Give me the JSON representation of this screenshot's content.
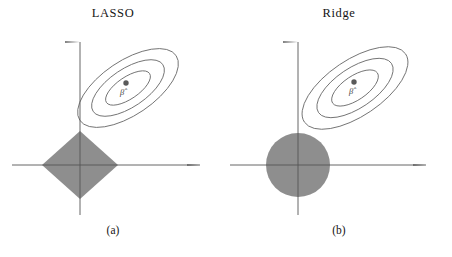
{
  "figure": {
    "type": "diagram",
    "background_color": "#ffffff",
    "axis_color": "#555555",
    "contour_color": "#6b6b6b",
    "region_fill_color": "#8e8e8e",
    "point_color": "#5a5a5a"
  },
  "panels": [
    {
      "id": "lasso",
      "title": "LASSO",
      "caption": "(a)",
      "constraint_shape": "diamond",
      "constraint_label": "l1-constraint-region",
      "estimate_label": "β̂",
      "axes": {
        "x_axis_name": "horizontal-axis",
        "y_axis_name": "vertical-axis",
        "origin_x": 80,
        "origin_y": 165,
        "x_end": 200,
        "y_end": 42
      },
      "region": {
        "center_x": 80,
        "center_y": 165,
        "half_width": 38,
        "half_height": 34
      },
      "contours": {
        "count": 3,
        "center_x": 128,
        "center_y": 88,
        "rotation_deg": -34,
        "radii": [
          {
            "rx": 26,
            "ry": 11
          },
          {
            "rx": 42,
            "ry": 19
          },
          {
            "rx": 58,
            "ry": 27
          }
        ]
      },
      "ols_point": {
        "x": 126,
        "y": 83
      },
      "estimate_text_pos": {
        "x": 122,
        "y": 95
      }
    },
    {
      "id": "ridge",
      "title": "Ridge",
      "caption": "(b)",
      "constraint_shape": "circle",
      "constraint_label": "l2-constraint-region",
      "estimate_label": "β̂",
      "axes": {
        "x_axis_name": "horizontal-axis",
        "y_axis_name": "vertical-axis",
        "origin_x": 72,
        "origin_y": 165,
        "x_end": 200,
        "y_end": 42
      },
      "region": {
        "center_x": 72,
        "center_y": 165,
        "radius": 32
      },
      "contours": {
        "count": 3,
        "center_x": 129,
        "center_y": 88,
        "rotation_deg": -34,
        "radii": [
          {
            "rx": 27,
            "ry": 12
          },
          {
            "rx": 44,
            "ry": 20
          },
          {
            "rx": 61,
            "ry": 28
          }
        ]
      },
      "ols_point": {
        "x": 128,
        "y": 82
      },
      "estimate_text_pos": {
        "x": 125,
        "y": 94
      }
    }
  ]
}
